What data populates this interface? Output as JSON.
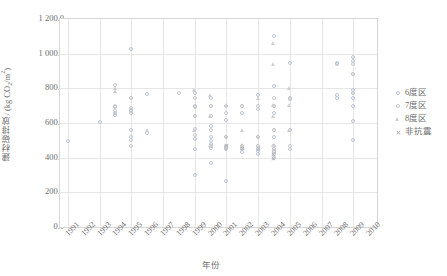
{
  "chart_data": {
    "type": "scatter",
    "title": "",
    "xlabel": "年份",
    "ylabel_text": "建材碳排放/ (kg CO",
    "ylabel_sub": "2",
    "ylabel_tail": "/m",
    "ylabel_sup": "2",
    "ylabel_close": ")",
    "xlim": [
      1990.5,
      2010.5
    ],
    "ylim": [
      0,
      1200
    ],
    "grid": true,
    "legend_position": "right",
    "xticks": [
      "1991",
      "1992",
      "1993",
      "1994",
      "1995",
      "1996",
      "1997",
      "1998",
      "1999",
      "2000",
      "2001",
      "2002",
      "2003",
      "2004",
      "2005",
      "2006",
      "2007",
      "2008",
      "2009",
      "2010"
    ],
    "yticks": [
      "0.0",
      "200.0",
      "400.0",
      "600.0",
      "800.0",
      "1 000.0",
      "1 200.0"
    ],
    "ytick_values": [
      0,
      200,
      400,
      600,
      800,
      1000,
      1200
    ],
    "series": [
      {
        "name": "6度区",
        "marker": "circle",
        "color": "#b9c6d9",
        "points": [
          [
            1991,
            498
          ],
          [
            1993,
            608
          ],
          [
            1994,
            690
          ],
          [
            1994,
            645
          ],
          [
            1994,
            658
          ],
          [
            1995,
            1028
          ],
          [
            1995,
            742
          ],
          [
            1995,
            676
          ],
          [
            1995,
            668
          ],
          [
            1995,
            560
          ],
          [
            1995,
            520
          ],
          [
            1996,
            768
          ],
          [
            1996,
            540
          ],
          [
            1999,
            775
          ],
          [
            1999,
            700
          ],
          [
            1999,
            642
          ],
          [
            1999,
            565
          ],
          [
            1999,
            505
          ],
          [
            1999,
            448
          ],
          [
            1999,
            300
          ],
          [
            2000,
            742
          ],
          [
            2000,
            700
          ],
          [
            2000,
            580
          ],
          [
            2000,
            520
          ],
          [
            2000,
            498
          ],
          [
            2000,
            480
          ],
          [
            2000,
            455
          ],
          [
            2000,
            368
          ],
          [
            2001,
            700
          ],
          [
            2001,
            620
          ],
          [
            2001,
            520
          ],
          [
            2001,
            462
          ],
          [
            2001,
            455
          ],
          [
            2001,
            448
          ],
          [
            2001,
            268
          ],
          [
            2002,
            700
          ],
          [
            2002,
            660
          ],
          [
            2002,
            470
          ],
          [
            2002,
            452
          ],
          [
            2002,
            430
          ],
          [
            2003,
            760
          ],
          [
            2003,
            682
          ],
          [
            2003,
            520
          ],
          [
            2003,
            470
          ],
          [
            2003,
            452
          ],
          [
            2003,
            440
          ],
          [
            2003,
            420
          ],
          [
            2004,
            1100
          ],
          [
            2004,
            812
          ],
          [
            2004,
            700
          ],
          [
            2004,
            660
          ],
          [
            2004,
            560
          ],
          [
            2004,
            520
          ],
          [
            2004,
            470
          ],
          [
            2004,
            452
          ],
          [
            2004,
            440
          ],
          [
            2004,
            420
          ],
          [
            2004,
            398
          ],
          [
            2005,
            948
          ],
          [
            2005,
            740
          ],
          [
            2005,
            560
          ],
          [
            2005,
            452
          ],
          [
            2008,
            948
          ],
          [
            2008,
            940
          ],
          [
            2008,
            760
          ],
          [
            2008,
            742
          ],
          [
            2009,
            978
          ],
          [
            2009,
            958
          ],
          [
            2009,
            880
          ],
          [
            2009,
            790
          ],
          [
            2009,
            775
          ],
          [
            2009,
            742
          ],
          [
            2009,
            700
          ],
          [
            2009,
            612
          ],
          [
            2009,
            500
          ]
        ]
      },
      {
        "name": "7度区",
        "marker": "circle",
        "color": "#c9c9c9",
        "points": [
          [
            1994,
            822
          ],
          [
            1994,
            700
          ],
          [
            1994,
            672
          ],
          [
            1995,
            742
          ],
          [
            1995,
            688
          ],
          [
            1995,
            660
          ],
          [
            1995,
            500
          ],
          [
            1995,
            470
          ],
          [
            1998,
            775
          ],
          [
            1999,
            745
          ],
          [
            1999,
            690
          ],
          [
            1999,
            640
          ],
          [
            1999,
            528
          ],
          [
            2000,
            700
          ],
          [
            2000,
            640
          ],
          [
            2000,
            560
          ],
          [
            2000,
            470
          ],
          [
            2001,
            660
          ],
          [
            2001,
            520
          ],
          [
            2001,
            470
          ],
          [
            2001,
            452
          ],
          [
            2002,
            700
          ],
          [
            2002,
            470
          ],
          [
            2002,
            455
          ],
          [
            2003,
            700
          ],
          [
            2003,
            520
          ],
          [
            2003,
            470
          ],
          [
            2004,
            742
          ],
          [
            2004,
            700
          ],
          [
            2004,
            560
          ],
          [
            2004,
            470
          ],
          [
            2004,
            452
          ],
          [
            2004,
            430
          ],
          [
            2005,
            742
          ],
          [
            2005,
            470
          ],
          [
            2009,
            940
          ],
          [
            2009,
            880
          ],
          [
            2009,
            775
          ]
        ]
      },
      {
        "name": "8度区",
        "marker": "triangle",
        "color": "#cfcfcf",
        "points": [
          [
            1994,
            800
          ],
          [
            1994,
            780
          ],
          [
            1996,
            560
          ],
          [
            1999,
            790
          ],
          [
            1999,
            560
          ],
          [
            2000,
            760
          ],
          [
            2000,
            640
          ],
          [
            2000,
            470
          ],
          [
            2001,
            700
          ],
          [
            2001,
            520
          ],
          [
            2002,
            560
          ],
          [
            2002,
            470
          ],
          [
            2003,
            740
          ],
          [
            2003,
            520
          ],
          [
            2004,
            1060
          ],
          [
            2004,
            940
          ],
          [
            2004,
            700
          ],
          [
            2004,
            640
          ],
          [
            2004,
            470
          ],
          [
            2005,
            800
          ],
          [
            2005,
            700
          ],
          [
            2005,
            560
          ]
        ]
      },
      {
        "name": "非抗震",
        "marker": "cross",
        "color": "#b5b5b5",
        "points": [
          [
            2001,
            470
          ],
          [
            2002,
            455
          ],
          [
            2003,
            452
          ],
          [
            2004,
            420
          ],
          [
            2004,
            398
          ]
        ]
      }
    ]
  },
  "legend": {
    "items": [
      {
        "label": "6度区",
        "marker": "circle",
        "color": "#b9c6d9"
      },
      {
        "label": "7度区",
        "marker": "circle",
        "color": "#c9c9c9"
      },
      {
        "label": "8度区",
        "marker": "triangle",
        "color": "#cfcfcf"
      },
      {
        "label": "非抗震",
        "marker": "cross",
        "color": "#b5b5b5"
      }
    ]
  }
}
